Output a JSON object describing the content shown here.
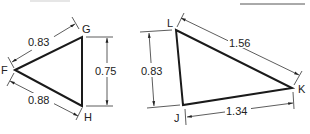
{
  "figures": [
    {
      "name": "triangle-FGH",
      "vertices": {
        "F": "F",
        "G": "G",
        "H": "H"
      },
      "dimensions": {
        "FG": "0.83",
        "GH": "0.75",
        "FH": "0.88"
      }
    },
    {
      "name": "triangle-LJK",
      "vertices": {
        "L": "L",
        "J": "J",
        "K": "K"
      },
      "dimensions": {
        "LK": "1.56",
        "LJ": "0.83",
        "JK": "1.34"
      }
    }
  ],
  "colors": {
    "stroke": "#1a1a1a",
    "dim_line": "#333333",
    "background": "#ffffff"
  }
}
